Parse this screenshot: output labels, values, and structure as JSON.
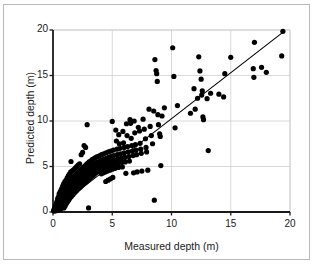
{
  "chart_data": {
    "type": "scatter",
    "title": "",
    "xlabel": "Measured depth (m)",
    "ylabel": "Predicted depth (m)",
    "xlim": [
      0,
      20
    ],
    "ylim": [
      0,
      20
    ],
    "xticks": [
      0,
      5,
      10,
      15,
      20
    ],
    "yticks": [
      0,
      5,
      10,
      15,
      20
    ],
    "grid": true,
    "grid_color": "#c8c8c8",
    "marker": "filled-circle",
    "marker_color": "#000000",
    "marker_size": 2.6,
    "legend": null,
    "annotations": [],
    "reference_line": {
      "name": "one-to-one-line",
      "x": [
        0.05,
        19.5
      ],
      "y": [
        0.2,
        19.85
      ],
      "color": "#000000",
      "width": 1.1
    },
    "points": [
      [
        0.05,
        0.15
      ],
      [
        0.1,
        0.3
      ],
      [
        0.12,
        0.1
      ],
      [
        0.15,
        0.45
      ],
      [
        0.18,
        0.2
      ],
      [
        0.2,
        0.6
      ],
      [
        0.22,
        0.35
      ],
      [
        0.25,
        0.8
      ],
      [
        0.26,
        0.15
      ],
      [
        0.3,
        1.0
      ],
      [
        0.3,
        0.5
      ],
      [
        0.32,
        0.25
      ],
      [
        0.35,
        1.2
      ],
      [
        0.38,
        0.7
      ],
      [
        0.4,
        0.3
      ],
      [
        0.4,
        1.5
      ],
      [
        0.42,
        0.95
      ],
      [
        0.45,
        0.2
      ],
      [
        0.48,
        1.7
      ],
      [
        0.5,
        1.1
      ],
      [
        0.5,
        0.4
      ],
      [
        0.52,
        2.0
      ],
      [
        0.55,
        1.35
      ],
      [
        0.58,
        0.6
      ],
      [
        0.6,
        2.2
      ],
      [
        0.6,
        1.6
      ],
      [
        0.62,
        0.85
      ],
      [
        0.65,
        0.3
      ],
      [
        0.68,
        2.4
      ],
      [
        0.7,
        1.85
      ],
      [
        0.7,
        1.15
      ],
      [
        0.72,
        0.5
      ],
      [
        0.75,
        2.6
      ],
      [
        0.78,
        2.05
      ],
      [
        0.8,
        1.4
      ],
      [
        0.8,
        0.75
      ],
      [
        0.82,
        2.85
      ],
      [
        0.85,
        2.3
      ],
      [
        0.88,
        1.65
      ],
      [
        0.9,
        1.0
      ],
      [
        0.9,
        3.1
      ],
      [
        0.92,
        0.45
      ],
      [
        0.95,
        2.5
      ],
      [
        0.98,
        1.9
      ],
      [
        1.0,
        1.25
      ],
      [
        1.0,
        3.3
      ],
      [
        1.02,
        0.65
      ],
      [
        1.05,
        2.7
      ],
      [
        1.08,
        2.1
      ],
      [
        1.1,
        1.5
      ],
      [
        1.1,
        3.5
      ],
      [
        1.12,
        0.9
      ],
      [
        1.15,
        2.95
      ],
      [
        1.18,
        2.35
      ],
      [
        1.2,
        1.7
      ],
      [
        1.2,
        3.75
      ],
      [
        1.22,
        1.1
      ],
      [
        1.25,
        3.15
      ],
      [
        1.28,
        2.55
      ],
      [
        1.3,
        1.95
      ],
      [
        1.3,
        4.0
      ],
      [
        1.32,
        1.3
      ],
      [
        1.35,
        3.35
      ],
      [
        1.38,
        2.75
      ],
      [
        1.4,
        2.15
      ],
      [
        1.4,
        4.2
      ],
      [
        1.42,
        1.5
      ],
      [
        1.45,
        3.55
      ],
      [
        1.48,
        2.9
      ],
      [
        1.5,
        2.3
      ],
      [
        1.5,
        4.4
      ],
      [
        1.52,
        5.55
      ],
      [
        1.55,
        1.7
      ],
      [
        1.58,
        3.7
      ],
      [
        1.6,
        3.05
      ],
      [
        1.6,
        2.45
      ],
      [
        1.65,
        4.55
      ],
      [
        1.68,
        1.9
      ],
      [
        1.7,
        3.85
      ],
      [
        1.72,
        3.2
      ],
      [
        1.75,
        2.6
      ],
      [
        1.78,
        4.7
      ],
      [
        1.8,
        2.1
      ],
      [
        1.82,
        4.0
      ],
      [
        1.85,
        3.35
      ],
      [
        1.88,
        2.75
      ],
      [
        1.9,
        4.85
      ],
      [
        1.92,
        2.25
      ],
      [
        1.95,
        4.15
      ],
      [
        1.98,
        3.5
      ],
      [
        2.0,
        2.9
      ],
      [
        2.0,
        5.0
      ],
      [
        2.02,
        2.4
      ],
      [
        2.05,
        4.3
      ],
      [
        2.08,
        3.65
      ],
      [
        2.1,
        3.05
      ],
      [
        2.12,
        5.15
      ],
      [
        2.15,
        2.55
      ],
      [
        2.18,
        4.45
      ],
      [
        2.2,
        3.8
      ],
      [
        2.2,
        3.2
      ],
      [
        2.25,
        5.3
      ],
      [
        2.28,
        2.7
      ],
      [
        2.3,
        4.6
      ],
      [
        2.32,
        3.95
      ],
      [
        2.35,
        3.35
      ],
      [
        2.38,
        6.3
      ],
      [
        2.4,
        2.85
      ],
      [
        2.42,
        4.75
      ],
      [
        2.45,
        4.1
      ],
      [
        2.48,
        3.5
      ],
      [
        2.5,
        6.55
      ],
      [
        2.5,
        3.0
      ],
      [
        2.55,
        4.9
      ],
      [
        2.58,
        4.25
      ],
      [
        2.6,
        3.65
      ],
      [
        2.62,
        7.3
      ],
      [
        2.65,
        3.15
      ],
      [
        2.68,
        5.05
      ],
      [
        2.7,
        4.4
      ],
      [
        2.72,
        3.8
      ],
      [
        2.75,
        7.1
      ],
      [
        2.78,
        3.3
      ],
      [
        2.8,
        5.2
      ],
      [
        2.82,
        4.55
      ],
      [
        2.85,
        3.95
      ],
      [
        2.88,
        9.6
      ],
      [
        2.9,
        3.45
      ],
      [
        2.92,
        5.35
      ],
      [
        2.95,
        4.7
      ],
      [
        2.98,
        4.1
      ],
      [
        3.0,
        0.45
      ],
      [
        3.0,
        3.6
      ],
      [
        3.05,
        5.5
      ],
      [
        3.08,
        4.85
      ],
      [
        3.1,
        4.25
      ],
      [
        3.15,
        3.75
      ],
      [
        3.18,
        5.6
      ],
      [
        3.2,
        5.0
      ],
      [
        3.25,
        4.4
      ],
      [
        3.28,
        3.9
      ],
      [
        3.3,
        5.75
      ],
      [
        3.32,
        5.15
      ],
      [
        3.35,
        4.55
      ],
      [
        3.4,
        4.05
      ],
      [
        3.42,
        5.85
      ],
      [
        3.45,
        5.25
      ],
      [
        3.5,
        4.7
      ],
      [
        3.52,
        4.2
      ],
      [
        3.55,
        5.95
      ],
      [
        3.6,
        5.35
      ],
      [
        3.62,
        4.8
      ],
      [
        3.65,
        4.35
      ],
      [
        3.7,
        6.05
      ],
      [
        3.72,
        5.45
      ],
      [
        3.75,
        4.9
      ],
      [
        3.8,
        4.45
      ],
      [
        3.82,
        6.1
      ],
      [
        3.85,
        5.5
      ],
      [
        3.9,
        5.0
      ],
      [
        3.92,
        4.55
      ],
      [
        3.95,
        6.2
      ],
      [
        4.0,
        5.6
      ],
      [
        4.0,
        5.1
      ],
      [
        4.05,
        4.65
      ],
      [
        4.08,
        4.2
      ],
      [
        4.1,
        6.3
      ],
      [
        4.15,
        5.7
      ],
      [
        4.18,
        5.2
      ],
      [
        4.2,
        4.75
      ],
      [
        4.25,
        4.3
      ],
      [
        4.28,
        6.4
      ],
      [
        4.3,
        5.8
      ],
      [
        4.35,
        5.3
      ],
      [
        4.38,
        4.85
      ],
      [
        4.4,
        4.4
      ],
      [
        4.45,
        3.35
      ],
      [
        4.48,
        6.5
      ],
      [
        4.5,
        5.9
      ],
      [
        4.55,
        5.4
      ],
      [
        4.58,
        4.95
      ],
      [
        4.6,
        4.5
      ],
      [
        4.65,
        3.5
      ],
      [
        4.68,
        6.6
      ],
      [
        4.7,
        6.0
      ],
      [
        4.75,
        5.5
      ],
      [
        4.78,
        5.05
      ],
      [
        4.8,
        4.6
      ],
      [
        4.85,
        3.65
      ],
      [
        4.88,
        6.7
      ],
      [
        4.9,
        6.1
      ],
      [
        4.95,
        5.6
      ],
      [
        4.98,
        5.15
      ],
      [
        5.0,
        4.7
      ],
      [
        5.0,
        9.95
      ],
      [
        5.05,
        3.8
      ],
      [
        5.1,
        6.8
      ],
      [
        5.12,
        6.2
      ],
      [
        5.15,
        5.7
      ],
      [
        5.2,
        5.25
      ],
      [
        5.25,
        4.8
      ],
      [
        5.3,
        9.0
      ],
      [
        5.35,
        7.8
      ],
      [
        5.4,
        6.9
      ],
      [
        5.42,
        6.3
      ],
      [
        5.45,
        5.8
      ],
      [
        5.5,
        5.35
      ],
      [
        5.52,
        4.9
      ],
      [
        5.55,
        8.5
      ],
      [
        5.6,
        7.5
      ],
      [
        5.65,
        7.0
      ],
      [
        5.7,
        6.4
      ],
      [
        5.75,
        5.9
      ],
      [
        5.8,
        5.45
      ],
      [
        5.85,
        4.95
      ],
      [
        5.9,
        8.85
      ],
      [
        5.95,
        7.6
      ],
      [
        6.0,
        7.1
      ],
      [
        6.0,
        6.5
      ],
      [
        6.05,
        6.0
      ],
      [
        6.1,
        5.5
      ],
      [
        6.15,
        4.25
      ],
      [
        6.2,
        9.7
      ],
      [
        6.25,
        8.4
      ],
      [
        6.3,
        7.2
      ],
      [
        6.35,
        6.6
      ],
      [
        6.4,
        6.1
      ],
      [
        6.45,
        5.6
      ],
      [
        6.5,
        10.15
      ],
      [
        6.55,
        9.75
      ],
      [
        6.6,
        8.1
      ],
      [
        6.65,
        7.3
      ],
      [
        6.7,
        6.7
      ],
      [
        6.75,
        6.2
      ],
      [
        6.8,
        4.3
      ],
      [
        6.85,
        10.0
      ],
      [
        6.9,
        8.7
      ],
      [
        6.95,
        7.4
      ],
      [
        7.0,
        6.8
      ],
      [
        7.05,
        6.3
      ],
      [
        7.1,
        4.4
      ],
      [
        7.2,
        9.3
      ],
      [
        7.3,
        8.9
      ],
      [
        7.35,
        7.55
      ],
      [
        7.4,
        6.9
      ],
      [
        7.45,
        6.45
      ],
      [
        7.5,
        4.5
      ],
      [
        7.6,
        10.2
      ],
      [
        7.7,
        9.1
      ],
      [
        7.8,
        8.05
      ],
      [
        7.85,
        7.1
      ],
      [
        7.9,
        6.6
      ],
      [
        8.0,
        4.6
      ],
      [
        8.1,
        11.3
      ],
      [
        8.2,
        9.4
      ],
      [
        8.3,
        8.4
      ],
      [
        8.4,
        7.5
      ],
      [
        8.5,
        11.1
      ],
      [
        8.55,
        1.3
      ],
      [
        8.6,
        16.75
      ],
      [
        8.7,
        15.55
      ],
      [
        8.75,
        15.2
      ],
      [
        8.8,
        14.35
      ],
      [
        8.85,
        10.7
      ],
      [
        8.9,
        9.6
      ],
      [
        9.0,
        8.6
      ],
      [
        9.05,
        8.3
      ],
      [
        9.1,
        5.1
      ],
      [
        9.2,
        10.55
      ],
      [
        9.4,
        11.45
      ],
      [
        10.1,
        18.05
      ],
      [
        10.2,
        14.9
      ],
      [
        10.3,
        9.25
      ],
      [
        10.5,
        11.7
      ],
      [
        11.6,
        10.85
      ],
      [
        11.9,
        13.55
      ],
      [
        12.0,
        11.3
      ],
      [
        12.2,
        12.5
      ],
      [
        12.3,
        17.05
      ],
      [
        12.4,
        15.5
      ],
      [
        12.5,
        14.6
      ],
      [
        12.55,
        12.85
      ],
      [
        12.6,
        13.3
      ],
      [
        12.65,
        10.45
      ],
      [
        12.7,
        10.15
      ],
      [
        13.0,
        12.45
      ],
      [
        13.1,
        6.75
      ],
      [
        13.3,
        13.05
      ],
      [
        14.0,
        12.95
      ],
      [
        14.4,
        12.65
      ],
      [
        14.5,
        15.2
      ],
      [
        15.0,
        17.0
      ],
      [
        16.9,
        15.75
      ],
      [
        16.95,
        14.8
      ],
      [
        17.0,
        18.65
      ],
      [
        17.6,
        15.9
      ],
      [
        18.0,
        15.35
      ],
      [
        19.3,
        17.15
      ],
      [
        19.4,
        19.85
      ]
    ]
  },
  "axis_style": {
    "axis_color": "#1a1a1a",
    "tick_color": "#1a1a1a",
    "frame_color": "#b9b9b9"
  }
}
